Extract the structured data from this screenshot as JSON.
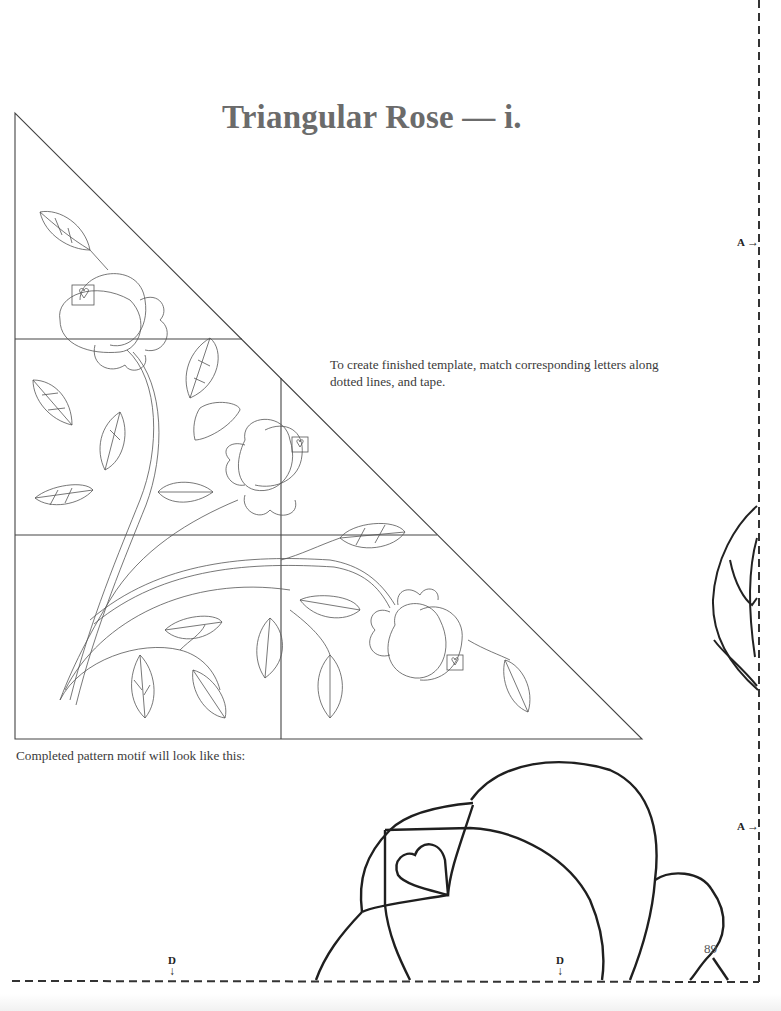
{
  "page": {
    "title": "Triangular Rose — i.",
    "instructions": "To create finished template, match corresponding letters along dotted lines, and tape.",
    "caption": "Completed pattern motif will look like this:",
    "page_number": "89"
  },
  "markers": {
    "a_top": {
      "letter": "A",
      "arrow": "→"
    },
    "a_bottom": {
      "letter": "A",
      "arrow": "→"
    },
    "d_left": {
      "letter": "D",
      "arrow": "↓"
    },
    "d_right": {
      "letter": "D",
      "arrow": "↓"
    }
  },
  "colors": {
    "ink": "#2a2a2a",
    "fine_line": "#555555",
    "title": "#6b6b6b",
    "paper": "#ffffff"
  }
}
